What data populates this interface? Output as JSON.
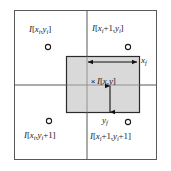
{
  "figure": {
    "background_color": "#ffffff",
    "frame_color": "#595959",
    "shade_fill": "#d9d9d9",
    "shade_border": "#2b2b2b",
    "arrow_color": "#111111",
    "text_color": "#1a1a1a"
  },
  "corner_labels": {
    "top_left": {
      "full": "I[xi,yi]",
      "fn": "I",
      "open": "[",
      "x_base": "x",
      "x_sub": "i",
      "comma": ",",
      "y_base": "y",
      "y_sub": "i",
      "close": "]"
    },
    "top_right": {
      "full": "I[xi+1,yi]",
      "fn": "I",
      "open": "[",
      "x_base": "x",
      "x_sub": "i",
      "x_offset": "+1",
      "comma": ",",
      "y_base": "y",
      "y_sub": "i",
      "close": "]"
    },
    "bottom_left": {
      "full": "I[xi,yi+1]",
      "fn": "I",
      "open": "[",
      "x_base": "x",
      "x_sub": "i",
      "comma": ",",
      "y_base": "y",
      "y_sub": "i",
      "y_offset": "+1",
      "close": "]"
    },
    "bottom_right": {
      "full": "I[xi+1,yi+1]",
      "fn": "I",
      "open": "[",
      "x_base": "x",
      "x_sub": "i",
      "x_offset": "+1",
      "comma": ",",
      "y_base": "y",
      "y_sub": "i",
      "y_offset": "+1",
      "close": "]"
    }
  },
  "center_label": {
    "full": "I[x,y]",
    "fn": "I",
    "open": "[",
    "x_base": "x",
    "comma": ",",
    "y_base": "y",
    "close": "]",
    "marker": "×"
  },
  "dimension_labels": {
    "x_fraction": {
      "full": "xf",
      "base": "x",
      "sub": "f"
    },
    "y_fraction": {
      "full": "yf",
      "base": "y",
      "sub": "f"
    }
  },
  "geometry": {
    "frame": {
      "x": 14,
      "y": 10,
      "width": 143,
      "height": 150
    },
    "grid_vertical_x": 87,
    "grid_horizontal_y": 85,
    "shaded_rect": {
      "x": 66,
      "y": 56,
      "width": 74,
      "height": 57
    },
    "pixel_dots": [
      {
        "name": "top-left",
        "cx": 48,
        "cy": 47,
        "r": 2.6
      },
      {
        "name": "top-right",
        "cx": 128,
        "cy": 47,
        "r": 2.6
      },
      {
        "name": "bottom-left",
        "cx": 49,
        "cy": 121,
        "r": 2.6
      },
      {
        "name": "bottom-right",
        "cx": 128,
        "cy": 122,
        "r": 2.6
      }
    ],
    "horizontal_arrow": {
      "x1": 88,
      "x2": 137,
      "y": 62
    },
    "vertical_arrow": {
      "x": 110,
      "y1": 86,
      "y2": 112
    },
    "sample_point": {
      "x": 93,
      "y": 82
    }
  }
}
